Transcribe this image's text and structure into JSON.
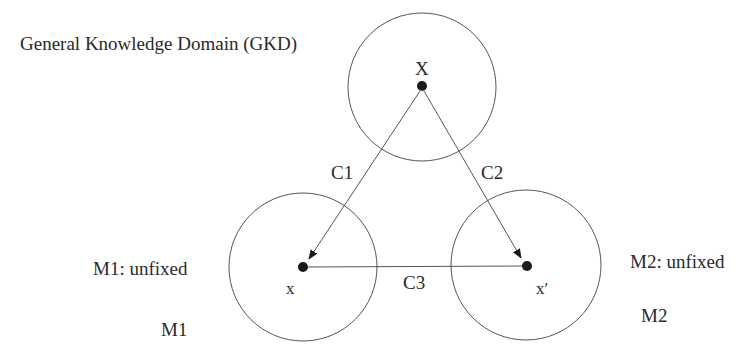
{
  "title": "General Knowledge Domain (GKD)",
  "nodes": {
    "top": {
      "label": "X",
      "domain": "GKD"
    },
    "left": {
      "label": "x",
      "model_status": "M1: unfixed",
      "model": "M1"
    },
    "right": {
      "label": "x′",
      "model_status": "M2: unfixed",
      "model": "M2"
    }
  },
  "edges": [
    {
      "label": "C1",
      "from": "X",
      "to": "x"
    },
    {
      "label": "C2",
      "from": "X",
      "to": "x′"
    },
    {
      "label": "C3",
      "from": "x",
      "to": "x′"
    }
  ],
  "colors": {
    "stroke": "#555555",
    "dot": "#1a1a1a",
    "text": "#2a2a2a"
  }
}
